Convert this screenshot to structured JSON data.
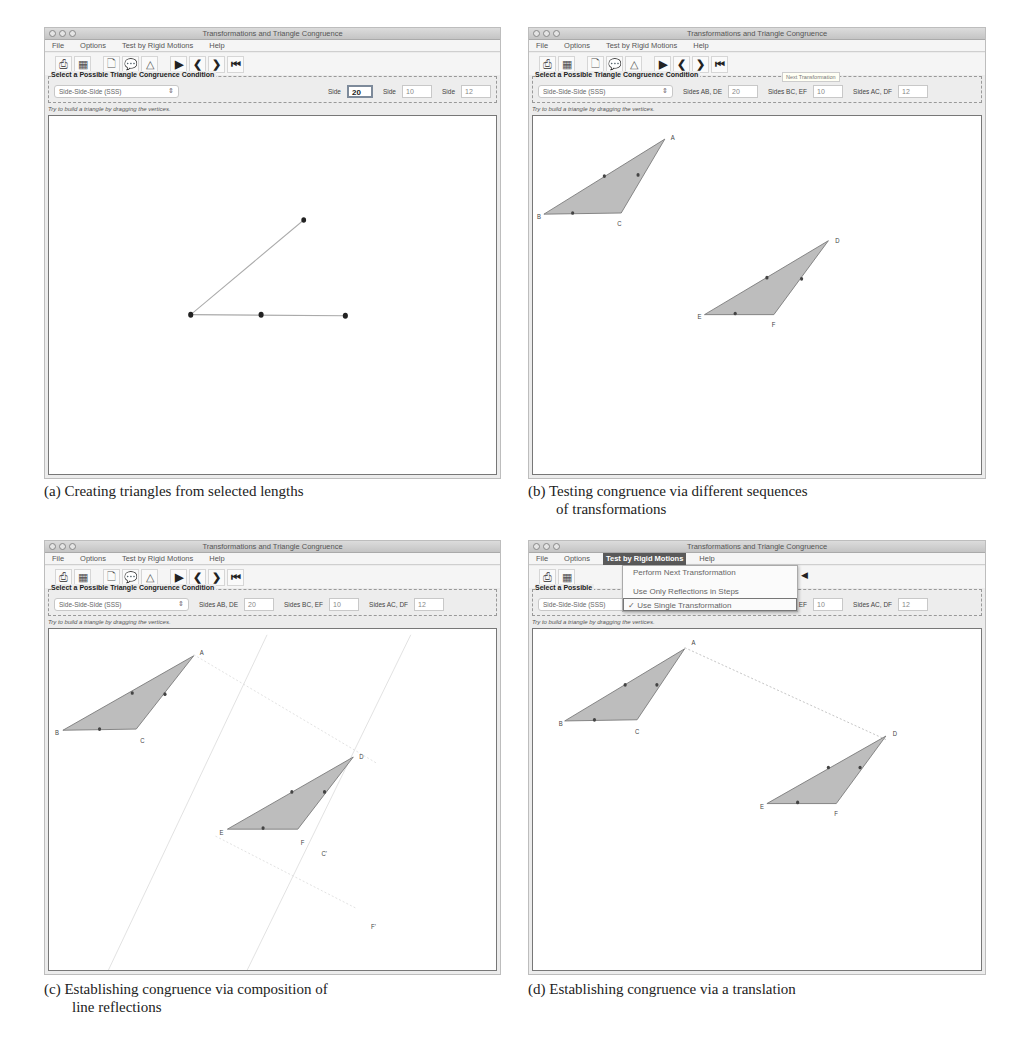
{
  "app": {
    "window_title": "Transformations and Triangle Congruence",
    "menus": [
      "File",
      "Options",
      "Test by Rigid Motions",
      "Help"
    ],
    "toolbar_icons": [
      "print-icon",
      "grid-icon",
      "new-page-icon",
      "speech-bubble-icon",
      "triangle-icon",
      "play-icon",
      "step-back-icon",
      "step-forward-icon",
      "rewind-icon"
    ],
    "toolbar_glyphs": [
      "⎙",
      "▦",
      "🗋",
      "💬",
      "△",
      "▶",
      "❮",
      "❯",
      "⏮"
    ],
    "group_title": "Select a Possible Triangle Congruence Condition",
    "status": "Try to build a triangle by dragging the vertices.",
    "colors": {
      "triangle_fill": "#bdbdbd",
      "canvas_border": "#777777",
      "menu_active": "#5a5a5a"
    }
  },
  "panels": [
    {
      "id": "a",
      "condition": "Side-Side-Side (SSS)",
      "fields": [
        {
          "label": "Side",
          "value": "20"
        },
        {
          "label": "Side",
          "value": "10"
        },
        {
          "label": "Side",
          "value": "12"
        }
      ],
      "caption": "(a) Creating triangles from selected lengths",
      "caption_cont": ""
    },
    {
      "id": "b",
      "condition": "Side-Side-Side (SSS)",
      "fields": [
        {
          "label": "Sides AB, DE",
          "value": "20"
        },
        {
          "label": "Sides BC, EF",
          "value": "10"
        },
        {
          "label": "Sides AC, DF",
          "value": "12"
        }
      ],
      "tooltip": "Next Transformation",
      "caption": "(b) Testing congruence via different sequences",
      "caption_cont": "of transformations"
    },
    {
      "id": "c",
      "condition": "Side-Side-Side (SSS)",
      "fields": [
        {
          "label": "Sides AB, DE",
          "value": "20"
        },
        {
          "label": "Sides BC, EF",
          "value": "10"
        },
        {
          "label": "Sides AC, DF",
          "value": "12"
        }
      ],
      "caption": "(c) Establishing congruence via composition of",
      "caption_cont": "line reflections"
    },
    {
      "id": "d",
      "condition": "Side-Side-Side (SSS)",
      "fields": [
        {
          "label": "Sides AB, DE",
          "value": "20"
        },
        {
          "label": "Sides BC, EF",
          "value": "10"
        },
        {
          "label": "Sides AC, DF",
          "value": "12"
        }
      ],
      "group_title_truncated": "Select a Possible",
      "menu_open": "Test by Rigid Motions",
      "dropdown_items": [
        {
          "label": "Perform Next Transformation",
          "checked": false
        },
        {
          "label": "Use Only Reflections in Steps",
          "checked": false
        },
        {
          "label": "✓ Use Single Transformation",
          "checked": true
        }
      ],
      "caption": "(d) Establishing congruence via a translation",
      "caption_cont": ""
    }
  ],
  "vertex_labels": {
    "A": "A",
    "B": "B",
    "C": "C",
    "D": "D",
    "E": "E",
    "F": "F",
    "C_prime": "C'",
    "F_prime": "F'"
  }
}
